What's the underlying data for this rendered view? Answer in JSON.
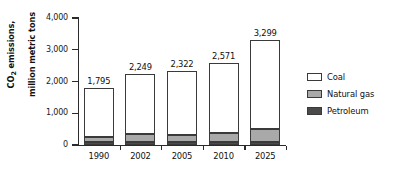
{
  "chart_data": {
    "type": "bar",
    "stacked": true,
    "title": "",
    "xlabel": "",
    "ylabel": "CO2 emissions,\nmillion metric tons",
    "ylabel_line1": "CO",
    "ylabel_sub": "2",
    "ylabel_line1_rest": " emissions,",
    "ylabel_line2": "million metric tons",
    "categories": [
      "1990",
      "2002",
      "2005",
      "2010",
      "2025"
    ],
    "ylim": [
      0,
      4000
    ],
    "yticks": [
      0,
      1000,
      2000,
      3000,
      4000
    ],
    "ytick_labels": [
      "0",
      "1,000",
      "2,000",
      "3,000",
      "4,000"
    ],
    "grid": false,
    "legend_position": "right",
    "series": [
      {
        "name": "Petroleum",
        "color": "#4a4a4a",
        "values": [
          110,
          85,
          80,
          85,
          90
        ]
      },
      {
        "name": "Natural gas",
        "color": "#a9a9a9",
        "values": [
          130,
          275,
          250,
          290,
          410
        ]
      },
      {
        "name": "Coal",
        "color": "#ffffff",
        "values": [
          1555,
          1889,
          1992,
          2196,
          2799
        ]
      }
    ],
    "totals": [
      1795,
      2249,
      2322,
      2571,
      3299
    ],
    "total_labels": [
      "1,795",
      "2,249",
      "2,322",
      "2,571",
      "3,299"
    ]
  },
  "legend": {
    "items": [
      {
        "label": "Coal",
        "swatch": "coal-swatch"
      },
      {
        "label": "Natural gas",
        "swatch": "natural-gas-swatch"
      },
      {
        "label": "Petroleum",
        "swatch": "petroleum-swatch"
      }
    ]
  }
}
